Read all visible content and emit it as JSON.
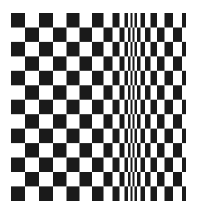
{
  "figure": {
    "kind": "monochrome-test-pattern",
    "canvas_width": 197,
    "canvas_height": 212,
    "background_color": "#ffffff",
    "foreground_color": "#1a1a1a"
  },
  "chart_data": {
    "type": "heatmap",
    "subtitle": "",
    "xlabel": "",
    "ylabel": "",
    "grid": false,
    "legend": "none",
    "colormap": [
      "#ffffff",
      "#1a1a1a"
    ],
    "value_labels": {
      "0": "white",
      "1": "black"
    },
    "plot_area": {
      "left": 11,
      "top": 13,
      "right": 186,
      "bottom": 201,
      "width": 175,
      "height": 188
    },
    "rows": 13,
    "row_height": 14.46,
    "row_boundaries": [
      13,
      27.5,
      41.9,
      56.4,
      70.8,
      85.3,
      99.7,
      114.2,
      128.6,
      143.1,
      157.5,
      172.0,
      186.4,
      201
    ],
    "column_boundaries": [
      11,
      25,
      39,
      53,
      66.5,
      79.5,
      92,
      103.5,
      112.5,
      119.5,
      124.5,
      128,
      130.5,
      132.5,
      134.5,
      137,
      140.5,
      145,
      150.5,
      157,
      164.5,
      173,
      182,
      186
    ],
    "column_widths": [
      14.0,
      14.0,
      14.0,
      13.5,
      13.0,
      12.5,
      11.5,
      9.0,
      7.0,
      5.0,
      3.5,
      2.5,
      2.0,
      2.0,
      2.5,
      3.5,
      4.5,
      5.5,
      6.5,
      7.5,
      8.5,
      9.0,
      4.0
    ],
    "columns": 23,
    "min_column_width_px": 2.0,
    "max_column_width_px": 14.0,
    "frequency_peak_x": 131,
    "phase_rule": "cell is black when (row_index + column_index) is even"
  }
}
